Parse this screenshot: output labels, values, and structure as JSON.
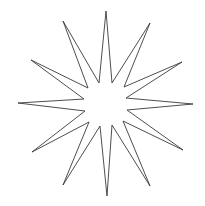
{
  "image": {
    "title": "Twelve-pointed starburst line drawing",
    "subject": "star",
    "style": "black outline line art on white background",
    "background_color": "#ffffff",
    "stroke_color": "#3a3a3a",
    "stroke_width": 0.9,
    "fill": "none",
    "canvas": {
      "width": 205,
      "height": 206
    }
  },
  "shape": {
    "name": "starburst",
    "point_count": 12,
    "center": {
      "x": 106,
      "y": 104
    },
    "inner_radius": 22,
    "spike_lengths": {
      "long_cardinal": 95,
      "long_diagonal": 100,
      "medium_intermediate": 92
    },
    "tips": [
      {
        "label": "top",
        "x": 106,
        "y": 11,
        "kind": "long"
      },
      {
        "label": "upper-right-short",
        "x": 150,
        "y": 23,
        "kind": "medium"
      },
      {
        "label": "upper-right-diagonal",
        "x": 182,
        "y": 62,
        "kind": "long"
      },
      {
        "label": "right",
        "x": 193,
        "y": 104,
        "kind": "long"
      },
      {
        "label": "lower-right-diagonal",
        "x": 183,
        "y": 150,
        "kind": "long"
      },
      {
        "label": "lower-right-short",
        "x": 150,
        "y": 186,
        "kind": "medium"
      },
      {
        "label": "bottom",
        "x": 107,
        "y": 196,
        "kind": "long"
      },
      {
        "label": "lower-left-short",
        "x": 63,
        "y": 185,
        "kind": "medium"
      },
      {
        "label": "lower-left-diagonal",
        "x": 32,
        "y": 152,
        "kind": "long"
      },
      {
        "label": "left",
        "x": 18,
        "y": 103,
        "kind": "long"
      },
      {
        "label": "upper-left-diagonal",
        "x": 31,
        "y": 60,
        "kind": "long"
      },
      {
        "label": "upper-left-short",
        "x": 63,
        "y": 21,
        "kind": "medium"
      }
    ],
    "inner_vertices": [
      {
        "x": 112,
        "y": 83
      },
      {
        "x": 124,
        "y": 87
      },
      {
        "x": 126,
        "y": 98
      },
      {
        "x": 127,
        "y": 110
      },
      {
        "x": 123,
        "y": 121
      },
      {
        "x": 112,
        "y": 125
      },
      {
        "x": 100,
        "y": 126
      },
      {
        "x": 89,
        "y": 122
      },
      {
        "x": 85,
        "y": 111
      },
      {
        "x": 84,
        "y": 99
      },
      {
        "x": 88,
        "y": 88
      },
      {
        "x": 99,
        "y": 83
      }
    ],
    "path": "M 106 11 L 112 83 L 150 23 L 124 87 L 182 62 L 126 98 L 193 104 L 127 110 L 183 150 L 123 121 L 150 186 L 112 125 L 107 196 L 100 126 L 63 185 L 89 122 L 32 152 L 85 111 L 18 103 L 84 99 L 31 60 L 88 88 L 63 21 L 99 83 Z"
  }
}
